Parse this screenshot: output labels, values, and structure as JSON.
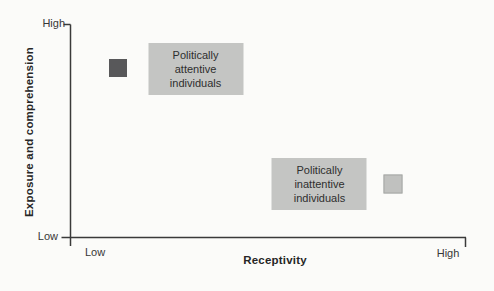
{
  "figure": {
    "background": "#fbfbf9"
  },
  "chart_data": {
    "type": "scatter",
    "title": "",
    "xlabel": "Receptivity",
    "ylabel": "Exposure and comprehension",
    "x_ticks": [
      "Low",
      "High"
    ],
    "y_ticks": [
      "Low",
      "High"
    ],
    "axis_color": "#3a3a3a",
    "grid": false,
    "legend": false,
    "points": [
      {
        "label": "Politically attentive individuals",
        "x_qualitative": "low",
        "y_qualitative": "high",
        "marker": {
          "x": 0.12,
          "y": 0.795,
          "size": 18,
          "color": "#58585a"
        },
        "label_box": {
          "x": 0.317,
          "y": 0.79,
          "fill": "#c4c5c3"
        }
      },
      {
        "label": "Politically inattentive individuals",
        "x_qualitative": "high",
        "y_qualitative": "low",
        "marker": {
          "x": 0.815,
          "y": 0.25,
          "size": 19,
          "color": "#c0c1bf"
        },
        "label_box": {
          "x": 0.63,
          "y": 0.252,
          "fill": "#c4c5c3"
        }
      }
    ]
  }
}
